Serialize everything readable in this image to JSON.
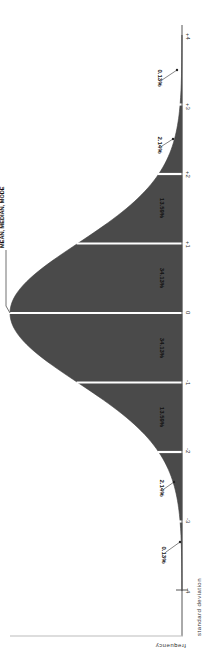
{
  "chart_data": {
    "type": "area",
    "xlabel": "standard deviation",
    "ylabel": "frequency",
    "annotation": "MEAN, MEDIAN, MODE",
    "orientation": "rotated 90° clockwise (standard deviation axis runs vertically, +4 at top, -4 at bottom)",
    "x_ticks": [
      "-4",
      "-3",
      "-2",
      "-1",
      "0",
      "+1",
      "+2",
      "+3",
      "+4"
    ],
    "segments": [
      {
        "from": "-4",
        "to": "-3",
        "percent": "0.13%",
        "value": 0.13
      },
      {
        "from": "-3",
        "to": "-2",
        "percent": "2.14%",
        "value": 2.14
      },
      {
        "from": "-2",
        "to": "-1",
        "percent": "13.59%",
        "value": 13.59
      },
      {
        "from": "-1",
        "to": "0",
        "percent": "34.13%",
        "value": 34.13
      },
      {
        "from": "0",
        "to": "+1",
        "percent": "34.13%",
        "value": 34.13
      },
      {
        "from": "+1",
        "to": "+2",
        "percent": "13.59%",
        "value": 13.59
      },
      {
        "from": "+2",
        "to": "+3",
        "percent": "2.14%",
        "value": 2.14
      },
      {
        "from": "+3",
        "to": "+4",
        "percent": "0.13%",
        "value": 0.13
      }
    ],
    "xlim": [
      -4,
      4
    ],
    "grid": false,
    "legend": "none",
    "fill_color": "#4a4a4a",
    "divider_color": "#ffffff"
  },
  "labels": {
    "annotation": "MEAN, MEDIAN, MODE",
    "xlabel": "standard deviation",
    "ylabel": "frequency",
    "ticks": {
      "p4": "+4",
      "p3": "+3",
      "p2": "+2",
      "p1": "+1",
      "z0": "0",
      "m1": "-1",
      "m2": "-2",
      "m3": "-3",
      "m4": "-4"
    },
    "pct": {
      "p34": "0.13%",
      "p23": "2.14%",
      "p12": "13.59%",
      "p01": "34.13%",
      "m01": "34.13%",
      "m12": "13.59%",
      "m23": "2.14%",
      "m34": "0.13%"
    }
  }
}
